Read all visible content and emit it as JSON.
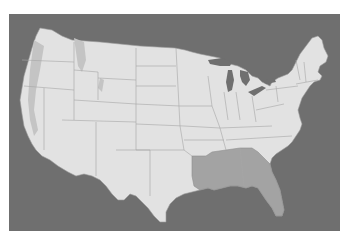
{
  "map": {
    "type": "choropleth",
    "region": "Contiguous United States",
    "colors": {
      "background": "#ffffff",
      "water": "#6f6f6f",
      "land": "#e2e2e2",
      "highlighted": "#a3a3a3",
      "state_borders": "#9a9a9a"
    },
    "highlighted_states": [
      "Louisiana",
      "Mississippi",
      "Alabama",
      "Georgia",
      "Florida"
    ]
  }
}
